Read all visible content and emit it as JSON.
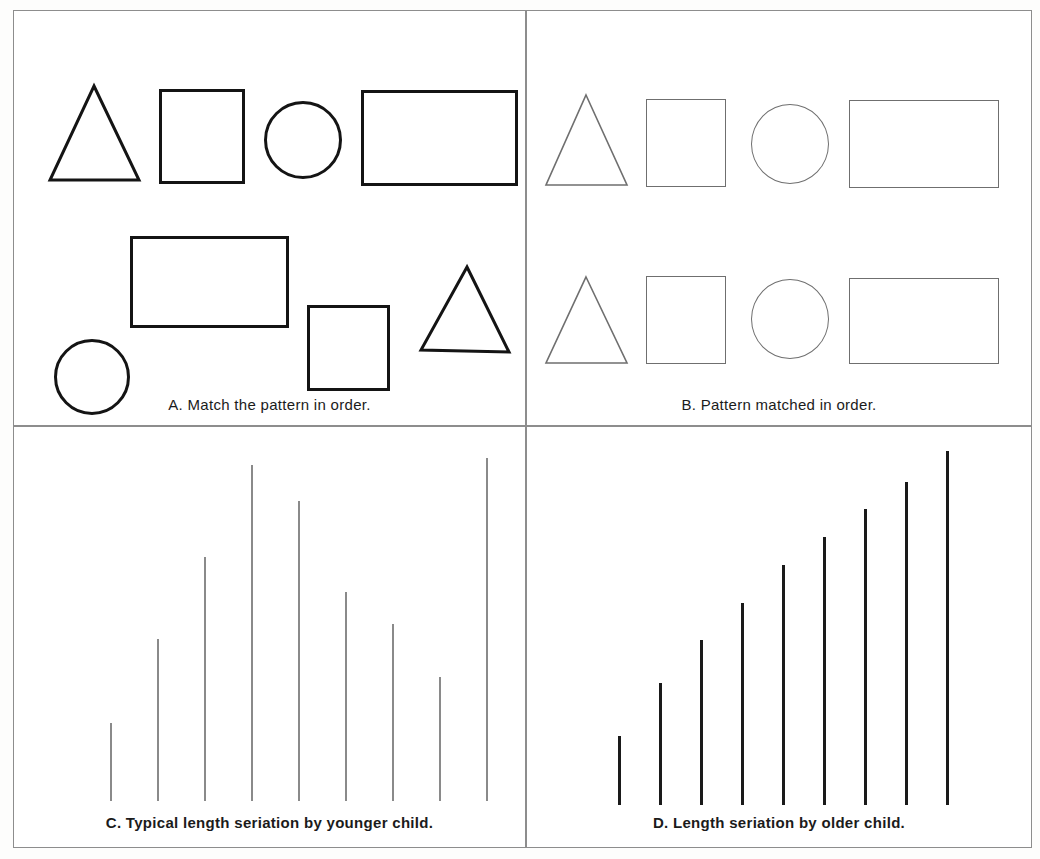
{
  "figure": {
    "title": "",
    "panels": [
      {
        "id": "A",
        "caption": "A.  Match the pattern in order.",
        "description": "model row of four shapes with a child's unordered copy below",
        "rows": [
          {
            "name": "model-row",
            "stroke": "#141414",
            "shapes": [
              {
                "type": "triangle",
                "x": 33,
                "y": 72,
                "w": 95,
                "h": 100
              },
              {
                "type": "square",
                "x": 145,
                "y": 78,
                "w": 86,
                "h": 95
              },
              {
                "type": "circle",
                "x": 250,
                "y": 90,
                "w": 78,
                "h": 78
              },
              {
                "type": "rectangle",
                "x": 347,
                "y": 79,
                "w": 157,
                "h": 96
              }
            ]
          },
          {
            "name": "child-copy-row",
            "stroke": "#141414",
            "shapes": [
              {
                "type": "circle",
                "x": 40,
                "y": 328,
                "w": 76,
                "h": 76
              },
              {
                "type": "rectangle",
                "x": 116,
                "y": 225,
                "w": 159,
                "h": 92
              },
              {
                "type": "square",
                "x": 293,
                "y": 294,
                "w": 83,
                "h": 86
              },
              {
                "type": "triangle",
                "x": 404,
                "y": 253,
                "w": 94,
                "h": 91
              }
            ]
          }
        ]
      },
      {
        "id": "B",
        "caption": "B.  Pattern matched in order.",
        "description": "model row and correctly ordered matched row",
        "rows": [
          {
            "name": "model-row",
            "stroke": "#6f6f6f",
            "shapes": [
              {
                "type": "triangle",
                "x": 17,
                "y": 82,
                "w": 85,
                "h": 94
              },
              {
                "type": "square",
                "x": 119,
                "y": 88,
                "w": 80,
                "h": 88
              },
              {
                "type": "circle",
                "x": 224,
                "y": 93,
                "w": 78,
                "h": 80
              },
              {
                "type": "rectangle",
                "x": 322,
                "y": 89,
                "w": 150,
                "h": 88
              }
            ]
          },
          {
            "name": "matched-row",
            "stroke": "#6f6f6f",
            "shapes": [
              {
                "type": "triangle",
                "x": 17,
                "y": 264,
                "w": 85,
                "h": 90
              },
              {
                "type": "square",
                "x": 119,
                "y": 265,
                "w": 80,
                "h": 88
              },
              {
                "type": "circle",
                "x": 224,
                "y": 268,
                "w": 78,
                "h": 80
              },
              {
                "type": "rectangle",
                "x": 322,
                "y": 267,
                "w": 150,
                "h": 86
              }
            ]
          }
        ]
      },
      {
        "id": "C",
        "caption": "C.  Typical length seriation by younger child.",
        "description": "nine sticks of varying length in a disordered sequence"
      },
      {
        "id": "D",
        "caption": "D.  Length seriation by older child.",
        "description": "nine sticks arranged in ascending length order"
      }
    ]
  },
  "chart_data": [
    {
      "type": "bar",
      "panel": "C",
      "title": "Typical length seriation by younger child.",
      "xlabel": "",
      "ylabel": "stick length",
      "categories": [
        "1",
        "2",
        "3",
        "4",
        "5",
        "6",
        "7",
        "8",
        "9"
      ],
      "values": [
        78,
        163,
        245,
        338,
        302,
        210,
        178,
        125,
        345
      ],
      "ylim": [
        0,
        360
      ],
      "grid": false,
      "legend": "none",
      "note": "Stick lengths are unordered; the child did not seriate them."
    },
    {
      "type": "bar",
      "panel": "D",
      "title": "Length seriation by older child.",
      "xlabel": "",
      "ylabel": "stick length",
      "categories": [
        "1",
        "2",
        "3",
        "4",
        "5",
        "6",
        "7",
        "8",
        "9"
      ],
      "values": [
        82,
        145,
        196,
        240,
        285,
        318,
        352,
        384,
        420
      ],
      "ylim": [
        0,
        430
      ],
      "grid": false,
      "legend": "none",
      "note": "Stick lengths increase monotonically; a correct seriation."
    }
  ],
  "colors": {
    "frame": "#8d8d8d",
    "dark_stroke": "#141414",
    "light_stroke": "#6f6f6f",
    "stick_light": "#8a8a8a",
    "stick_dark": "#1a1a1a",
    "background": "#ffffff",
    "text": "#1b1b1b"
  }
}
